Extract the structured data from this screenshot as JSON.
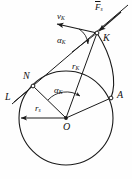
{
  "figure": {
    "type": "involute-gear-tooth-geometry-diagram",
    "background_color": "#fefefe",
    "stroke_color": "#1a1a1a",
    "labels": {
      "point_K": "K",
      "point_N": "N",
      "point_A": "A",
      "point_O": "O",
      "line_L": "L",
      "velocity_vector": "v",
      "velocity_vector_sub": "K",
      "force_vector": "F",
      "force_vector_sub": "s",
      "radius_K": "r",
      "radius_K_sub": "K",
      "radius_base": "r",
      "radius_base_sub": "s",
      "angle_at_K": "α",
      "angle_at_K_sub": "K",
      "angle_at_O": "α",
      "angle_at_O_sub": "K"
    },
    "geometry": {
      "center_O": [
        66,
        118
      ],
      "base_circle_radius": 47,
      "point_N": [
        33,
        86
      ],
      "point_A": [
        111,
        98
      ],
      "point_K": [
        97,
        33
      ],
      "tangent_line_label_end": [
        14,
        102
      ],
      "involute_from": "A",
      "involute_to": "K"
    }
  }
}
